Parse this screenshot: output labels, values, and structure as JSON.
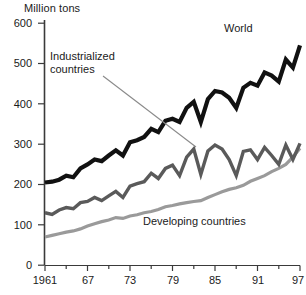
{
  "chart_data": {
    "type": "line",
    "title": "",
    "subtitle": "",
    "ylabel": "Million tons",
    "xlabel": "",
    "ylim": [
      0,
      600
    ],
    "xlim": [
      1961,
      1997
    ],
    "y_ticks": [
      0,
      100,
      200,
      300,
      400,
      500,
      600
    ],
    "y_tick_labels": [
      "0",
      "100",
      "200",
      "300",
      "400",
      "500",
      "600"
    ],
    "x_ticks": [
      1961,
      1967,
      1973,
      1979,
      1985,
      1991,
      1997
    ],
    "x_tick_labels": [
      "1961",
      "67",
      "73",
      "79",
      "85",
      "91",
      "97"
    ],
    "x_minor_ticks": [
      1964,
      1970,
      1976,
      1982,
      1988,
      1994
    ],
    "grid": false,
    "legend_position": "inline-annotations",
    "x": [
      1961,
      1962,
      1963,
      1964,
      1965,
      1966,
      1967,
      1968,
      1969,
      1970,
      1971,
      1972,
      1973,
      1974,
      1975,
      1976,
      1977,
      1978,
      1979,
      1980,
      1981,
      1982,
      1983,
      1984,
      1985,
      1986,
      1987,
      1988,
      1989,
      1990,
      1991,
      1992,
      1993,
      1994,
      1995,
      1996,
      1997
    ],
    "series": [
      {
        "name": "World",
        "color": "#111111",
        "values": [
          205,
          207,
          212,
          222,
          218,
          240,
          250,
          262,
          258,
          272,
          285,
          272,
          305,
          310,
          318,
          338,
          330,
          358,
          363,
          355,
          390,
          405,
          355,
          412,
          432,
          428,
          415,
          390,
          440,
          452,
          445,
          478,
          470,
          455,
          510,
          490,
          545
        ]
      },
      {
        "name": "Industrialized countries",
        "color": "#5a5a5a",
        "values": [
          130,
          126,
          137,
          143,
          140,
          155,
          158,
          168,
          160,
          172,
          183,
          168,
          196,
          202,
          207,
          228,
          215,
          240,
          248,
          222,
          268,
          288,
          225,
          283,
          298,
          288,
          262,
          222,
          282,
          286,
          262,
          292,
          272,
          250,
          298,
          262,
          302
        ]
      },
      {
        "name": "Developing countries",
        "color": "#9a9a9a",
        "values": [
          70,
          74,
          78,
          82,
          85,
          90,
          97,
          103,
          108,
          112,
          118,
          116,
          122,
          125,
          130,
          133,
          138,
          145,
          148,
          152,
          155,
          158,
          160,
          168,
          175,
          182,
          188,
          192,
          198,
          208,
          215,
          222,
          232,
          240,
          250,
          268,
          290
        ]
      }
    ],
    "annotations": [
      {
        "text": "Industrialized countries",
        "lines": [
          "Industrialized",
          "countries"
        ],
        "leader_line": true,
        "points_to_series": "Industrialized countries"
      },
      {
        "text": "World",
        "lines": [
          "World"
        ],
        "leader_line": false,
        "points_to_series": "World"
      },
      {
        "text": "Developing countries",
        "lines": [
          "Developing countries"
        ],
        "leader_line": false,
        "points_to_series": "Developing countries"
      }
    ]
  },
  "axis": {
    "y_title": "Million tons",
    "y_labels": [
      "600",
      "500",
      "400",
      "300",
      "200",
      "100",
      "0"
    ],
    "x_labels": [
      "1961",
      "67",
      "73",
      "79",
      "85",
      "91",
      "97"
    ]
  },
  "labels": {
    "industrialized_line1": "Industrialized",
    "industrialized_line2": "countries",
    "world": "World",
    "developing": "Developing countries"
  },
  "colors": {
    "world": "#111111",
    "industrialized": "#5a5a5a",
    "developing": "#9a9a9a",
    "axis": "#3a3a3a",
    "background": "#ffffff",
    "leader": "#8a8a8a"
  }
}
